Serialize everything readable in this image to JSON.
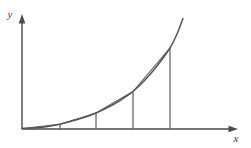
{
  "figure": {
    "background_color": "#ffffff",
    "stroke_color": "#4a4a4a",
    "curve_color": "#555555",
    "chord_color": "#555555",
    "ordinate_color": "#5a5a5a",
    "axes": {
      "x_axis": {
        "label": "x",
        "label_x": 236,
        "label_y": 142,
        "start_x": 22,
        "end_x": 238,
        "y": 129,
        "arrow": "right"
      },
      "y_axis": {
        "label": "y",
        "label_x": 10,
        "label_y": 18,
        "x": 22,
        "start_y": 129,
        "end_y": 14,
        "arrow": "up"
      }
    },
    "origin": {
      "x": 22,
      "y": 129
    },
    "curve": {
      "description": "increasing convex curve",
      "points": [
        {
          "x": 22,
          "y": 128.5
        },
        {
          "x": 34,
          "y": 128.0
        },
        {
          "x": 46,
          "y": 126.8
        },
        {
          "x": 60,
          "y": 124.3
        },
        {
          "x": 72,
          "y": 121.0
        },
        {
          "x": 84,
          "y": 117.6
        },
        {
          "x": 96,
          "y": 113.0
        },
        {
          "x": 108,
          "y": 107.4
        },
        {
          "x": 120,
          "y": 100.6
        },
        {
          "x": 133,
          "y": 91.5
        },
        {
          "x": 145,
          "y": 80.0
        },
        {
          "x": 157,
          "y": 66.0
        },
        {
          "x": 170,
          "y": 48.0
        },
        {
          "x": 177,
          "y": 34.0
        },
        {
          "x": 183,
          "y": 18.5
        }
      ]
    },
    "ordinates": [
      {
        "name": "ordinate-1",
        "x": 60,
        "top_y": 124.3,
        "bottom_y": 129
      },
      {
        "name": "ordinate-2",
        "x": 96,
        "top_y": 113.0,
        "bottom_y": 129
      },
      {
        "name": "ordinate-3",
        "x": 133,
        "top_y": 91.5,
        "bottom_y": 129
      },
      {
        "name": "ordinate-4",
        "x": 170,
        "top_y": 48.0,
        "bottom_y": 129
      }
    ],
    "chords": [
      {
        "name": "chord-1",
        "x1": 22,
        "y1": 128.5,
        "x2": 60,
        "y2": 124.3
      },
      {
        "name": "chord-2",
        "x1": 60,
        "y1": 124.3,
        "x2": 96,
        "y2": 113.0
      },
      {
        "name": "chord-3",
        "x1": 96,
        "y1": 113.0,
        "x2": 133,
        "y2": 91.5
      },
      {
        "name": "chord-4",
        "x1": 133,
        "y1": 91.5,
        "x2": 170,
        "y2": 48.0
      }
    ]
  }
}
